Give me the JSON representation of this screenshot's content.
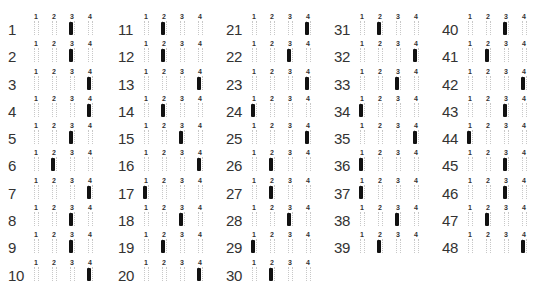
{
  "sheet": {
    "option_labels": [
      "1",
      "2",
      "3",
      "4"
    ],
    "columns": [
      {
        "questions": [
          {
            "n": "1",
            "answer": 3
          },
          {
            "n": "2",
            "answer": 3
          },
          {
            "n": "3",
            "answer": 4
          },
          {
            "n": "4",
            "answer": 4
          },
          {
            "n": "5",
            "answer": 3
          },
          {
            "n": "6",
            "answer": 2
          },
          {
            "n": "7",
            "answer": 4
          },
          {
            "n": "8",
            "answer": 3
          },
          {
            "n": "9",
            "answer": 3
          },
          {
            "n": "10",
            "answer": 4
          }
        ]
      },
      {
        "questions": [
          {
            "n": "11",
            "answer": 2
          },
          {
            "n": "12",
            "answer": 2
          },
          {
            "n": "13",
            "answer": 4
          },
          {
            "n": "14",
            "answer": 2
          },
          {
            "n": "15",
            "answer": 3
          },
          {
            "n": "16",
            "answer": 4
          },
          {
            "n": "17",
            "answer": 1
          },
          {
            "n": "18",
            "answer": 3
          },
          {
            "n": "19",
            "answer": 2
          },
          {
            "n": "20",
            "answer": 4
          }
        ]
      },
      {
        "questions": [
          {
            "n": "21",
            "answer": 4
          },
          {
            "n": "22",
            "answer": 3
          },
          {
            "n": "23",
            "answer": 4
          },
          {
            "n": "24",
            "answer": 1
          },
          {
            "n": "25",
            "answer": 4
          },
          {
            "n": "26",
            "answer": 2
          },
          {
            "n": "27",
            "answer": 2
          },
          {
            "n": "28",
            "answer": 3
          },
          {
            "n": "29",
            "answer": 1
          },
          {
            "n": "30",
            "answer": 2
          }
        ]
      },
      {
        "questions": [
          {
            "n": "31",
            "answer": 2
          },
          {
            "n": "32",
            "answer": 4
          },
          {
            "n": "33",
            "answer": 3
          },
          {
            "n": "34",
            "answer": 1
          },
          {
            "n": "35",
            "answer": 4
          },
          {
            "n": "36",
            "answer": 1
          },
          {
            "n": "37",
            "answer": 1
          },
          {
            "n": "38",
            "answer": 3
          },
          {
            "n": "39",
            "answer": 2
          }
        ]
      },
      {
        "questions": [
          {
            "n": "40",
            "answer": 3
          },
          {
            "n": "41",
            "answer": 2
          },
          {
            "n": "42",
            "answer": 4
          },
          {
            "n": "43",
            "answer": 3
          },
          {
            "n": "44",
            "answer": 1
          },
          {
            "n": "45",
            "answer": 3
          },
          {
            "n": "46",
            "answer": 3
          },
          {
            "n": "47",
            "answer": 2
          },
          {
            "n": "48",
            "answer": 4
          }
        ]
      }
    ]
  }
}
